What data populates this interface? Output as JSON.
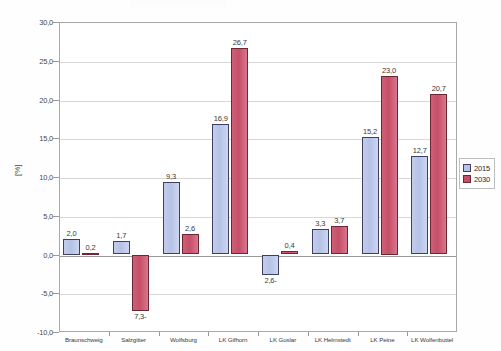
{
  "chart_data": {
    "type": "bar",
    "title": "",
    "xlabel": "",
    "ylabel": "[%]",
    "ylim": [
      -10.0,
      30.0
    ],
    "ytick_step": 5.0,
    "grid": true,
    "legend_position": "right",
    "categories": [
      "Braunschweig",
      "Salzgitter",
      "Wolfsburg",
      "LK Gifhorn",
      "LK Goslar",
      "LK Helmstedt",
      "LK Peine",
      "LK Wolfenbuttel"
    ],
    "ytick_labels": [
      "30,0",
      "25,0",
      "20,0",
      "15,0",
      "10,0",
      "5,0",
      "0,0",
      "-5,0",
      "-10,0"
    ],
    "ytick_values": [
      30,
      25,
      20,
      15,
      10,
      5,
      0,
      -5,
      -10
    ],
    "series": [
      {
        "name": "2015",
        "color": "#b5c2e6",
        "values": [
          2.0,
          1.7,
          9.3,
          16.9,
          -2.6,
          3.3,
          15.2,
          12.7
        ],
        "labels": [
          "2,0",
          "1,7",
          "9,3",
          "16,9",
          "2,6-",
          "3,3",
          "15,2",
          "12,7"
        ]
      },
      {
        "name": "2030",
        "color": "#c54f69",
        "values": [
          0.2,
          -7.3,
          2.6,
          26.7,
          0.4,
          3.7,
          23.0,
          20.7
        ],
        "labels": [
          "0,2",
          "7,3-",
          "2,6",
          "26,7",
          "0,4",
          "3,7",
          "23,0",
          "20,7"
        ]
      }
    ]
  },
  "legend": {
    "items": [
      {
        "label": "2015",
        "color": "#b5c2e6"
      },
      {
        "label": "2030",
        "color": "#c54f69"
      }
    ]
  }
}
